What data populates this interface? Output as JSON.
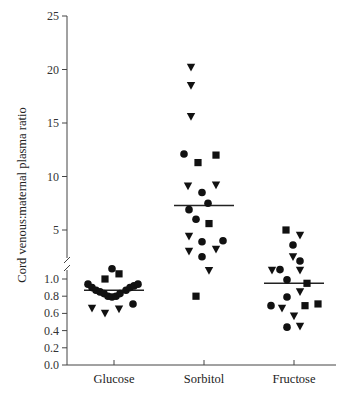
{
  "chart_data": {
    "type": "scatter",
    "title": "",
    "xlabel": "",
    "ylabel": "Cord venous:maternal plasma ratio",
    "categories": [
      "Glucose",
      "Sorbitol",
      "Fructose"
    ],
    "y_axis": {
      "broken": true,
      "lower_segment": {
        "range": [
          0.0,
          1.0
        ],
        "ticks": [
          "0.0",
          "0.2",
          "0.4",
          "0.6",
          "0.8",
          "1.0"
        ]
      },
      "upper_segment": {
        "range": [
          1.0,
          25
        ],
        "ticks": [
          "5",
          "10",
          "15",
          "20",
          "25"
        ]
      }
    },
    "grid": false,
    "legend": null,
    "marker_types": [
      "circle",
      "square",
      "triangle-down"
    ],
    "series": [
      {
        "name": "Glucose",
        "median": 0.87,
        "points": [
          {
            "marker": "circle",
            "value": 1.12
          },
          {
            "marker": "square",
            "value": 1.06
          },
          {
            "marker": "square",
            "value": 1.0
          },
          {
            "marker": "circle",
            "value": 0.94
          },
          {
            "marker": "circle",
            "value": 0.9
          },
          {
            "marker": "circle",
            "value": 0.87
          },
          {
            "marker": "circle",
            "value": 0.85
          },
          {
            "marker": "circle",
            "value": 0.83
          },
          {
            "marker": "circle",
            "value": 0.8
          },
          {
            "marker": "circle",
            "value": 0.79
          },
          {
            "marker": "circle",
            "value": 0.8
          },
          {
            "marker": "circle",
            "value": 0.83
          },
          {
            "marker": "circle",
            "value": 0.87
          },
          {
            "marker": "circle",
            "value": 0.9
          },
          {
            "marker": "circle",
            "value": 0.92
          },
          {
            "marker": "circle",
            "value": 0.94
          },
          {
            "marker": "circle",
            "value": 0.71
          },
          {
            "marker": "triangle-down",
            "value": 0.66
          },
          {
            "marker": "triangle-down",
            "value": 0.6
          },
          {
            "marker": "triangle-down",
            "value": 0.65
          }
        ]
      },
      {
        "name": "Sorbitol",
        "median": 7.3,
        "points": [
          {
            "marker": "triangle-down",
            "value": 20.2
          },
          {
            "marker": "triangle-down",
            "value": 18.5
          },
          {
            "marker": "triangle-down",
            "value": 15.6
          },
          {
            "marker": "circle",
            "value": 12.1
          },
          {
            "marker": "square",
            "value": 12.0
          },
          {
            "marker": "square",
            "value": 11.3
          },
          {
            "marker": "triangle-down",
            "value": 9.1
          },
          {
            "marker": "triangle-down",
            "value": 9.2
          },
          {
            "marker": "circle",
            "value": 8.5
          },
          {
            "marker": "circle",
            "value": 7.5
          },
          {
            "marker": "circle",
            "value": 6.9
          },
          {
            "marker": "circle",
            "value": 6.0
          },
          {
            "marker": "square",
            "value": 5.6
          },
          {
            "marker": "triangle-down",
            "value": 4.4
          },
          {
            "marker": "circle",
            "value": 3.9
          },
          {
            "marker": "circle",
            "value": 4.0
          },
          {
            "marker": "triangle-down",
            "value": 3.0
          },
          {
            "marker": "triangle-down",
            "value": 3.2
          },
          {
            "marker": "circle",
            "value": 2.5
          },
          {
            "marker": "triangle-down",
            "value": 1.2
          },
          {
            "marker": "square",
            "value": 0.8
          }
        ]
      },
      {
        "name": "Fructose",
        "median": 0.95,
        "points": [
          {
            "marker": "square",
            "value": 5.0
          },
          {
            "marker": "triangle-down",
            "value": 4.5
          },
          {
            "marker": "circle",
            "value": 3.6
          },
          {
            "marker": "triangle-down",
            "value": 2.5
          },
          {
            "marker": "circle",
            "value": 2.1
          },
          {
            "marker": "triangle-down",
            "value": 1.1
          },
          {
            "marker": "circle",
            "value": 1.3
          },
          {
            "marker": "triangle-down",
            "value": 1.1
          },
          {
            "marker": "circle",
            "value": 0.99
          },
          {
            "marker": "square",
            "value": 0.95
          },
          {
            "marker": "triangle-down",
            "value": 0.85
          },
          {
            "marker": "circle",
            "value": 0.79
          },
          {
            "marker": "circle",
            "value": 0.69
          },
          {
            "marker": "triangle-down",
            "value": 0.66
          },
          {
            "marker": "square",
            "value": 0.69
          },
          {
            "marker": "square",
            "value": 0.71
          },
          {
            "marker": "triangle-down",
            "value": 0.57
          },
          {
            "marker": "circle",
            "value": 0.44
          },
          {
            "marker": "triangle-down",
            "value": 0.45
          }
        ]
      }
    ]
  },
  "colors": {
    "axis": "#444444",
    "marker": "#111111",
    "median_line": "#222222",
    "text": "#222222"
  }
}
